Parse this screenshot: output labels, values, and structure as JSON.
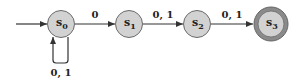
{
  "diagram": {
    "type": "finite-automaton",
    "colors": {
      "state_fill": "#d2d2d2",
      "state_stroke": "#6a6a6a",
      "accept_ring": "#7a7a7a",
      "edge": "#333333"
    },
    "start_state": "s0",
    "states": [
      {
        "id": "s0",
        "base": "s",
        "sub": "0",
        "accepting": false
      },
      {
        "id": "s1",
        "base": "s",
        "sub": "1",
        "accepting": false
      },
      {
        "id": "s2",
        "base": "s",
        "sub": "2",
        "accepting": false
      },
      {
        "id": "s3",
        "base": "s",
        "sub": "3",
        "accepting": true
      }
    ],
    "transitions": [
      {
        "from": "s0",
        "to": "s0",
        "label": "0, 1"
      },
      {
        "from": "s0",
        "to": "s1",
        "label": "0"
      },
      {
        "from": "s1",
        "to": "s2",
        "label": "0, 1"
      },
      {
        "from": "s2",
        "to": "s3",
        "label": "0, 1"
      }
    ]
  }
}
